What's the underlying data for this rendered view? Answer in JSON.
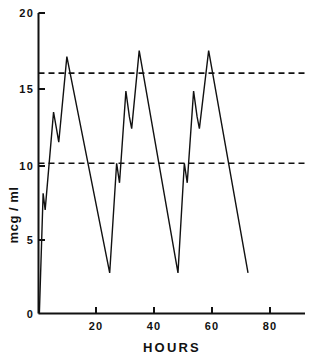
{
  "chart_data": {
    "type": "line",
    "title": "",
    "xlabel": "HOURS",
    "ylabel": "mcg / ml",
    "xlim": [
      0,
      90
    ],
    "ylim": [
      0,
      20
    ],
    "grid": false,
    "legend": "none",
    "x_ticks": [
      20,
      40,
      60,
      80
    ],
    "x_tick_labels": [
      "20",
      "40",
      "60",
      "80"
    ],
    "y_ticks": [
      0,
      5,
      10,
      15,
      20
    ],
    "y_tick_labels": [
      "0",
      "5",
      "10",
      "15",
      "20"
    ],
    "series": [
      {
        "name": "serum concentration",
        "style": "solid",
        "points": [
          [
            0.3,
            0.0
          ],
          [
            1.6,
            8.0
          ],
          [
            2.3,
            6.9
          ],
          [
            5.2,
            13.4
          ],
          [
            6.3,
            12.2
          ],
          [
            7.0,
            11.4
          ],
          [
            9.8,
            17.1
          ],
          [
            24.6,
            2.7
          ],
          [
            27.0,
            10.0
          ],
          [
            28.0,
            8.7
          ],
          [
            30.2,
            14.8
          ],
          [
            31.4,
            13.1
          ],
          [
            32.2,
            12.3
          ],
          [
            34.8,
            17.5
          ],
          [
            48.2,
            2.7
          ],
          [
            50.4,
            10.0
          ],
          [
            51.4,
            8.7
          ],
          [
            53.6,
            14.8
          ],
          [
            54.8,
            13.1
          ],
          [
            55.6,
            12.3
          ],
          [
            58.8,
            17.5
          ],
          [
            72.4,
            2.7
          ]
        ]
      }
    ],
    "reference_lines": [
      {
        "name": "upper-threshold",
        "value": 16,
        "style": "dashed",
        "orientation": "horizontal"
      },
      {
        "name": "lower-threshold",
        "value": 10,
        "style": "dashed",
        "orientation": "horizontal"
      }
    ]
  },
  "axes": {
    "y_title": "mcg / ml",
    "x_title": "HOURS"
  }
}
